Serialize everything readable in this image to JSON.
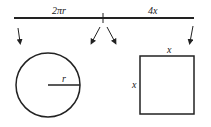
{
  "diagram": {
    "labels": {
      "left_segment": "2πr",
      "right_segment": "4x",
      "radius": "r",
      "square_top": "x",
      "square_left": "x"
    },
    "colors": {
      "stroke": "#222222",
      "background": "#ffffff"
    }
  }
}
